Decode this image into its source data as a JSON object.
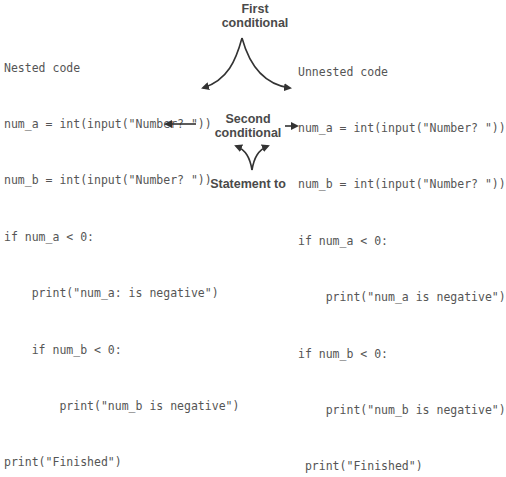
{
  "nested": {
    "title": "Nested code",
    "lines": [
      "num_a = int(input(\"Number? \"))",
      "num_b = int(input(\"Number? \"))",
      "if num_a < 0:",
      "    print(\"num_a: is negative\")",
      "    if num_b < 0:",
      "        print(\"num_b is negative\")",
      "print(\"Finished\")"
    ]
  },
  "unnested": {
    "title": "Unnested code",
    "lines": [
      "num_a = int(input(\"Number? \"))",
      "num_b = int(input(\"Number? \"))",
      "if num_a < 0:",
      "    print(\"num_a is negative\")",
      "if num_b < 0:",
      "    print(\"num_b is negative\")",
      " print(\"Finished\")"
    ]
  },
  "labels": {
    "first_conditional": [
      "First",
      "conditional"
    ],
    "second_conditional": [
      "Second",
      "conditional"
    ],
    "statement_to": [
      "Statement to"
    ]
  },
  "colors": {
    "code_text": "#555555",
    "label_text": "#4a4a4a",
    "arrow": "#333333"
  }
}
